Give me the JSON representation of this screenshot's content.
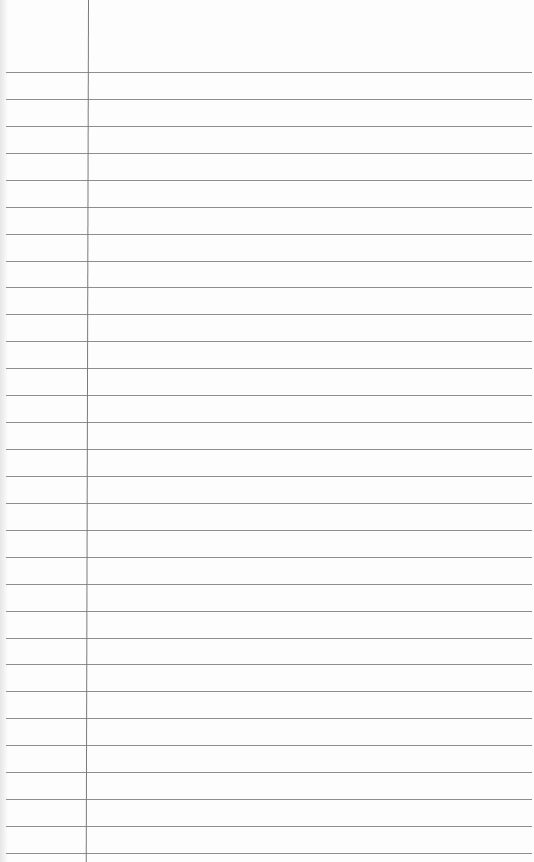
{
  "paper": {
    "type": "ruled notebook page",
    "line_color": "#8e8e8e",
    "margin_line_color": "#7a7a7a",
    "background": "#fdfdfd",
    "first_line_y": 72,
    "line_spacing": 26.93,
    "line_count": 30,
    "margin_line_x": 88
  }
}
